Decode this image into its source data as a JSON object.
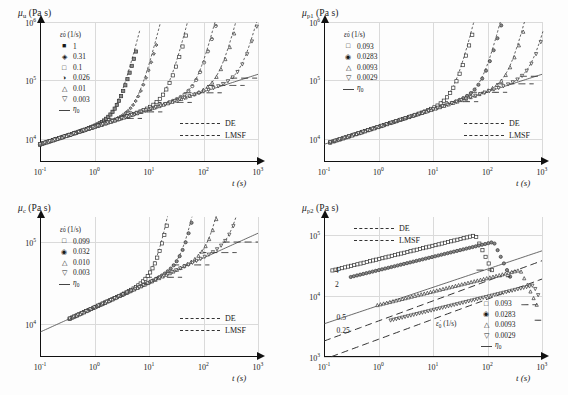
{
  "figure": {
    "caption": "",
    "background": "#fdfdfd",
    "grid_color": "#dadada",
    "axis_color": "#111111"
  },
  "shared": {
    "xlabel": "t (s)",
    "xticks": [
      "10-1",
      "100",
      "101",
      "102",
      "103"
    ],
    "xtick_mant": [
      "10",
      "10",
      "10",
      "10",
      "10"
    ],
    "xtick_exp": [
      "-1",
      "0",
      "1",
      "2",
      "3"
    ],
    "xlim_exp": [
      -1,
      3
    ],
    "units": "Pa s",
    "rate_header": "ε̃0 (1/s)",
    "eta_label": "η0",
    "de_label": "DE",
    "lmsf_label": "LMSF"
  },
  "chart_data": [
    {
      "id": "panel-mu-u",
      "position": "top-left",
      "type": "line",
      "title": "μu (Pa s)",
      "ysym": "μ",
      "ysub": "u",
      "xlabel": "t (s)",
      "ylabel": "μu (Pa s)",
      "xscale": "log",
      "yscale": "log",
      "xlim": [
        0.1,
        1000
      ],
      "ylim": [
        4000,
        1000000
      ],
      "ytick_mant": [
        "10",
        "10",
        "10"
      ],
      "ytick_exp": [
        "4",
        "5",
        "6"
      ],
      "yticks": [
        "104",
        "105",
        "106"
      ],
      "grid": true,
      "legend_position": "upper-left",
      "legend_header": "ε̃0 (1/s)",
      "series": [
        {
          "name": "1",
          "rate": 1,
          "marker": "filled-square",
          "strain_start": 0.1,
          "break_t": 5.5,
          "plateau": 95000
        },
        {
          "name": "0.31",
          "rate": 0.31,
          "marker": "diamond",
          "strain_start": 0.1,
          "break_t": 13,
          "plateau": 95000
        },
        {
          "name": "0.1",
          "rate": 0.1,
          "marker": "open-square",
          "strain_start": 0.1,
          "break_t": 45,
          "plateau": 95000
        },
        {
          "name": "0.026",
          "rate": 0.026,
          "marker": "half-circle",
          "strain_start": 0.1,
          "break_t": 160,
          "plateau": 95000
        },
        {
          "name": "0.01",
          "rate": 0.01,
          "marker": "triangle-up",
          "strain_start": 0.1,
          "break_t": 420,
          "plateau": 95000
        },
        {
          "name": "0.003",
          "rate": 0.003,
          "marker": "triangle-down",
          "strain_start": 0.1,
          "break_t": 1100,
          "plateau": 95000
        }
      ],
      "models": [
        "DE",
        "LMSF",
        "η0"
      ]
    },
    {
      "id": "panel-mu-p1",
      "position": "top-right",
      "type": "line",
      "title": "μp1 (Pa s)",
      "ysym": "μ",
      "ysub": "p1",
      "xlabel": "t (s)",
      "ylabel": "μp1 (Pa s)",
      "xscale": "log",
      "yscale": "log",
      "xlim": [
        0.1,
        1000
      ],
      "ylim": [
        4000,
        1000000
      ],
      "ytick_mant": [
        "10",
        "10",
        "10"
      ],
      "ytick_exp": [
        "4",
        "5",
        "6"
      ],
      "yticks": [
        "104",
        "105",
        "106"
      ],
      "grid": true,
      "legend_position": "upper-left",
      "legend_header": "ε̃0 (1/s)",
      "series": [
        {
          "name": "0.093",
          "rate": 0.093,
          "marker": "open-square",
          "strain_start": 0.13,
          "break_t": 50,
          "plateau": 90000
        },
        {
          "name": "0.0283",
          "rate": 0.0283,
          "marker": "filled-circle",
          "strain_start": 0.13,
          "break_t": 170,
          "plateau": 90000
        },
        {
          "name": "0.0093",
          "rate": 0.0093,
          "marker": "triangle-up",
          "strain_start": 0.13,
          "break_t": 520,
          "plateau": 90000
        },
        {
          "name": "0.0029",
          "rate": 0.0029,
          "marker": "triangle-down",
          "strain_start": 0.13,
          "break_t": 1400,
          "plateau": 90000
        }
      ],
      "models": [
        "DE",
        "LMSF",
        "η0"
      ]
    },
    {
      "id": "panel-mu-c",
      "position": "bottom-left",
      "type": "line",
      "title": "μc (Pa s)",
      "ysym": "μ",
      "ysub": "c",
      "xlabel": "t (s)",
      "ylabel": "μc (Pa s)",
      "xscale": "log",
      "yscale": "log",
      "xlim": [
        0.1,
        1000
      ],
      "ylim": [
        4000,
        200000
      ],
      "ytick_mant": [
        "10",
        "10"
      ],
      "ytick_exp": [
        "4",
        "5"
      ],
      "yticks": [
        "104",
        "105"
      ],
      "grid": true,
      "legend_position": "upper-left",
      "legend_header": "ε̃0 (1/s)",
      "series": [
        {
          "name": "0.099",
          "rate": 0.099,
          "marker": "open-square",
          "strain_start": 0.35,
          "break_t": 30,
          "plateau": 60000
        },
        {
          "name": "0.032",
          "rate": 0.032,
          "marker": "filled-circle",
          "strain_start": 0.35,
          "break_t": 95,
          "plateau": 60000
        },
        {
          "name": "0.010",
          "rate": 0.01,
          "marker": "triangle-up",
          "strain_start": 0.35,
          "break_t": 300,
          "plateau": 60000
        },
        {
          "name": "0.003",
          "rate": 0.003,
          "marker": "triangle-down",
          "strain_start": 0.35,
          "break_t": 800,
          "plateau": 60000
        }
      ],
      "models": [
        "DE",
        "LMSF",
        "η0"
      ]
    },
    {
      "id": "panel-mu-p2",
      "position": "bottom-right",
      "type": "line",
      "title": "μp2 (Pa s)",
      "ysym": "μ",
      "ysub": "p2",
      "xlabel": "t (s)",
      "ylabel": "μp2 (Pa s)",
      "xscale": "log",
      "yscale": "log",
      "xlim": [
        0.1,
        1000
      ],
      "ylim": [
        1000,
        200000
      ],
      "ytick_mant": [
        "10",
        "10",
        "10"
      ],
      "ytick_exp": [
        "3",
        "4",
        "5"
      ],
      "yticks": [
        "103",
        "104",
        "105"
      ],
      "grid": true,
      "legend_position": "lower-right",
      "legend_header": "ε̃0 (1/s)",
      "annotations": [
        {
          "label": "4",
          "x": 0.16,
          "y": 26000
        },
        {
          "label": "2",
          "x": 0.16,
          "y": 15500
        },
        {
          "label": "0.5",
          "x": 0.17,
          "y": 4300
        },
        {
          "label": "0.25",
          "x": 0.17,
          "y": 2700
        }
      ],
      "series": [
        {
          "name": "0.093",
          "rate": 0.093,
          "marker": "open-square",
          "peak_t": 60,
          "peak_v": 100000
        },
        {
          "name": "0.0283",
          "rate": 0.0283,
          "marker": "filled-circle",
          "peak_t": 130,
          "peak_v": 78000
        },
        {
          "name": "0.0093",
          "rate": 0.0093,
          "marker": "triangle-up",
          "peak_t": 400,
          "peak_v": 27000
        },
        {
          "name": "0.0029",
          "rate": 0.0029,
          "marker": "triangle-down",
          "peak_t": 700,
          "peak_v": 15000
        }
      ],
      "models": [
        "DE",
        "LMSF",
        "η0"
      ]
    }
  ]
}
